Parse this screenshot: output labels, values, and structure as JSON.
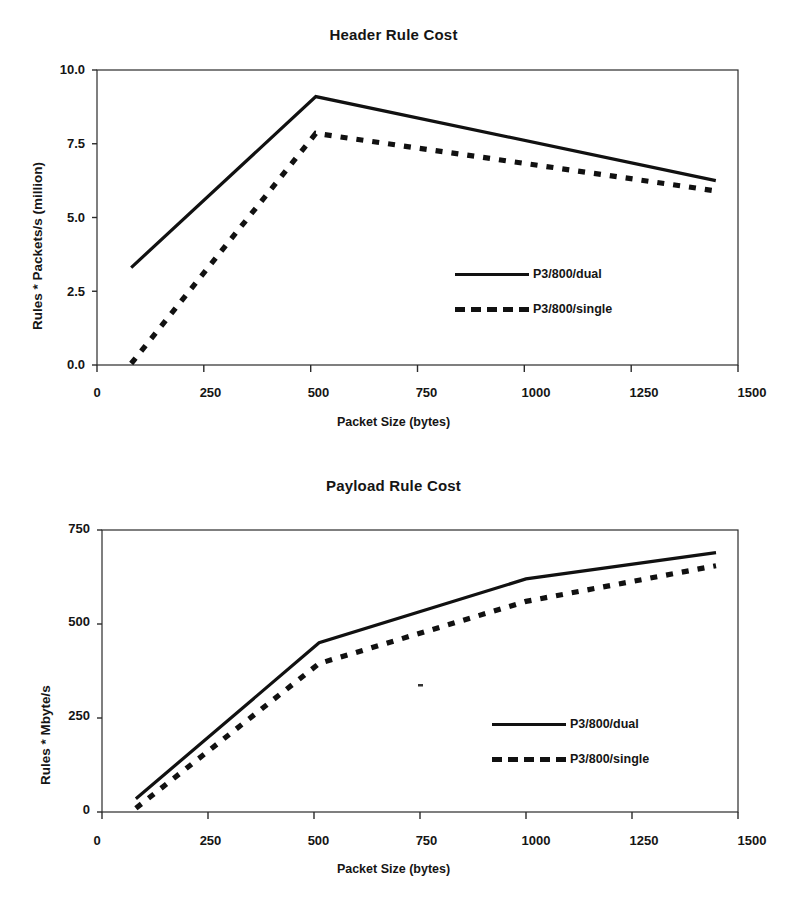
{
  "figures": [
    {
      "title": "Header Rule Cost",
      "ylabel": "Rules * Packets/s (million)",
      "xlabel": "Packet Size (bytes)",
      "yticks": [
        "10.0",
        "7.5",
        "5.0",
        "2.5",
        "0.0"
      ],
      "xticks": [
        "0",
        "250",
        "500",
        "750",
        "1000",
        "1250",
        "1500"
      ],
      "legend": [
        {
          "label": "P3/800/dual",
          "style": "solid"
        },
        {
          "label": "P3/800/single",
          "style": "dashed"
        }
      ]
    },
    {
      "title": "Payload Rule Cost",
      "ylabel": "Rules * Mbyte/s",
      "xlabel": "Packet Size (bytes)",
      "yticks": [
        "750",
        "500",
        "250",
        "0"
      ],
      "xticks": [
        "0",
        "250",
        "500",
        "750",
        "1000",
        "1250",
        "1500"
      ],
      "legend": [
        {
          "label": "P3/800/dual",
          "style": "solid"
        },
        {
          "label": "P3/800/single",
          "style": "dashed"
        }
      ]
    }
  ],
  "chart_data": [
    {
      "type": "line",
      "title": "Header Rule Cost",
      "xlabel": "Packet Size (bytes)",
      "ylabel": "Rules * Packets/s (million)",
      "xlim": [
        0,
        1500
      ],
      "ylim": [
        0.0,
        10.0
      ],
      "xticks": [
        0,
        250,
        500,
        750,
        1000,
        1250,
        1500
      ],
      "yticks": [
        0.0,
        2.5,
        5.0,
        7.5,
        10.0
      ],
      "grid": false,
      "legend_position": "center-right",
      "series": [
        {
          "name": "P3/800/dual",
          "style": "solid",
          "x": [
            80,
            512,
            1448
          ],
          "y": [
            3.3,
            9.1,
            6.25
          ]
        },
        {
          "name": "P3/800/single",
          "style": "dashed",
          "x": [
            80,
            512,
            1448
          ],
          "y": [
            0.05,
            7.85,
            5.9
          ]
        }
      ]
    },
    {
      "type": "line",
      "title": "Payload Rule Cost",
      "xlabel": "Packet Size (bytes)",
      "ylabel": "Rules * Mbyte/s",
      "xlim": [
        0,
        1500
      ],
      "ylim": [
        0,
        750
      ],
      "xticks": [
        0,
        250,
        500,
        750,
        1000,
        1250,
        1500
      ],
      "yticks": [
        0,
        250,
        500,
        750
      ],
      "grid": false,
      "legend_position": "center-right",
      "series": [
        {
          "name": "P3/800/dual",
          "style": "solid",
          "x": [
            80,
            512,
            1000,
            1448
          ],
          "y": [
            35,
            450,
            620,
            690
          ]
        },
        {
          "name": "P3/800/single",
          "style": "dashed",
          "x": [
            80,
            512,
            1000,
            1448
          ],
          "y": [
            10,
            395,
            560,
            655
          ]
        }
      ]
    }
  ]
}
